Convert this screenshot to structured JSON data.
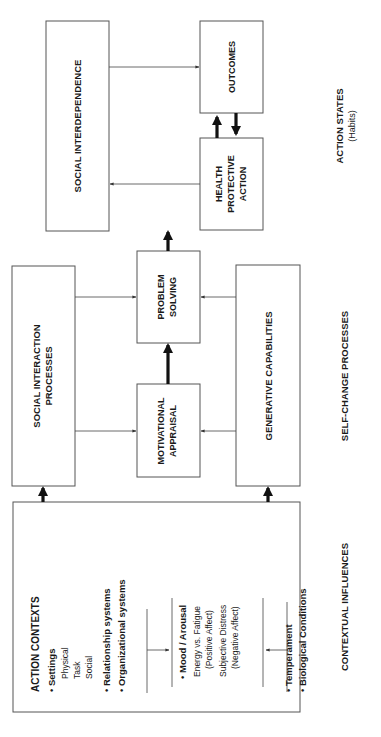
{
  "diagram": {
    "boxes": {
      "social_interdependence": [
        "SOCIAL INTERDEPENDENCE"
      ],
      "outcomes": [
        "OUTCOMES"
      ],
      "health_protective_action": [
        "HEALTH",
        "PROTECTIVE",
        "ACTION"
      ],
      "social_interaction_processes": [
        "SOCIAL INTERACTION",
        "PROCESSES"
      ],
      "problem_solving": [
        "PROBLEM",
        "SOLVING"
      ],
      "motivational_appraisal": [
        "MOTIVATIONAL",
        "APPRAISAL"
      ],
      "generative_capabilities": [
        "GENERATIVE CAPABILITIES"
      ]
    },
    "action_contexts": {
      "title": "ACTION CONTEXTS",
      "settings_label": "• Settings",
      "settings_items": [
        "Physical",
        "Task",
        "Social"
      ],
      "relationship": "• Relationship systems",
      "organizational": "• Organizational systems",
      "mood_label": "• Mood / Arousal",
      "mood_lines": [
        "Energy vs. Fatigue",
        "(Positive Affect)",
        "Subjective Distress",
        "(Negative Affect)"
      ],
      "temperament": "• Temperament",
      "biological": "• Biological Conditions"
    },
    "column_labels": {
      "contextual": "CONTEXTUAL INFLUENCES",
      "self_change": "SELF-CHANGE PROCESSES",
      "action_states": "ACTION STATES",
      "action_states_sub": "(Habits)"
    }
  }
}
